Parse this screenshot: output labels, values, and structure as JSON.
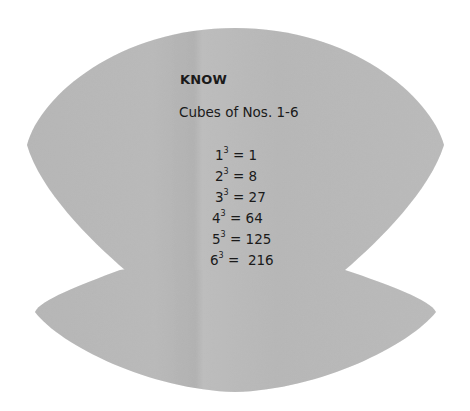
{
  "card": {
    "title": "KNOW",
    "subtitle": "Cubes of Nos. 1-6",
    "fill_color": "#b8b8b8",
    "text_color": "#1a1a1a",
    "equations": [
      {
        "base": "1",
        "exp": "3",
        "rhs": "= 1"
      },
      {
        "base": "2",
        "exp": "3",
        "rhs": "= 8"
      },
      {
        "base": "3",
        "exp": "3",
        "rhs": "= 27"
      },
      {
        "base": "4",
        "exp": "3",
        "rhs": "= 64"
      },
      {
        "base": "5",
        "exp": "3",
        "rhs": "= 125"
      },
      {
        "base": "6",
        "exp": "3",
        "rhs": "=  216"
      }
    ]
  }
}
